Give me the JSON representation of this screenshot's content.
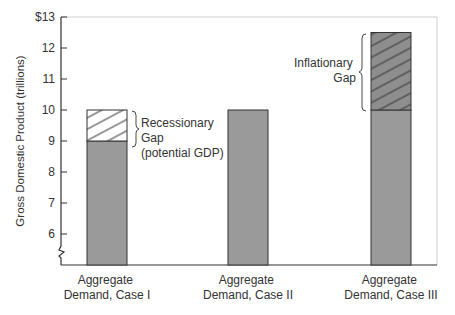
{
  "chart_data": {
    "type": "bar",
    "title": "",
    "xlabel": "",
    "ylabel": "Gross Domestic Product (trillions)",
    "ylim": [
      5,
      13
    ],
    "yticks": [
      6,
      7,
      8,
      9,
      10,
      11,
      12,
      13
    ],
    "ytick_labels": [
      "6",
      "7",
      "8",
      "9",
      "10",
      "11",
      "12",
      "$13"
    ],
    "axis_break": true,
    "grid": false,
    "categories": [
      "Aggregate\nDemand, Case I",
      "Aggregate\nDemand, Case II",
      "Aggregate\nDemand, Case III"
    ],
    "series": [
      {
        "name": "Aggregate Demand (actual GDP)",
        "values": [
          9,
          10,
          10
        ],
        "color": "#9a9a9a"
      },
      {
        "name": "Gap",
        "values": [
          1,
          0,
          2.5
        ],
        "styles": [
          "hatch-white",
          "none",
          "hatch-gray"
        ]
      }
    ],
    "potential_gdp": 10,
    "annotations": [
      {
        "text": "Recessionary\nGap\n(potential GDP)",
        "target": "Aggregate Demand, Case I",
        "range": [
          9,
          10
        ]
      },
      {
        "text": "Inflationary\nGap",
        "target": "Aggregate Demand, Case III",
        "range": [
          10,
          12.5
        ]
      }
    ]
  },
  "labels": {
    "y_axis_title": "Gross Domestic Product (trillions)",
    "ticks": [
      "6",
      "7",
      "8",
      "9",
      "10",
      "11",
      "12",
      "$13"
    ],
    "categories": [
      [
        "Aggregate",
        "Demand, Case I"
      ],
      [
        "Aggregate",
        "Demand, Case II"
      ],
      [
        "Aggregate",
        "Demand, Case III"
      ]
    ],
    "recessionary": [
      "Recessionary",
      "Gap",
      "(potential GDP)"
    ],
    "inflationary": [
      "Inflationary",
      "Gap"
    ]
  },
  "colors": {
    "bar_fill": "#9a9a9a",
    "hatch_line": "#333333",
    "axis": "#333333",
    "frame": "#cfcfcf"
  }
}
